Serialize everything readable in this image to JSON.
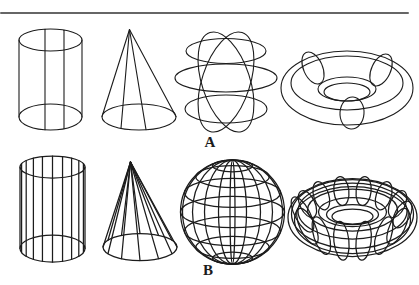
{
  "page": {
    "background": "#ffffff",
    "line_color": "#1c1c1c",
    "rule_color": "#666666"
  },
  "figure": {
    "rows": [
      {
        "label": "A",
        "style": "coarse-wireframe",
        "shapes": [
          "cylinder",
          "cone",
          "sphere",
          "torus"
        ]
      },
      {
        "label": "B",
        "style": "dense-wireframe",
        "shapes": [
          "cylinder",
          "cone",
          "sphere",
          "torus"
        ]
      }
    ]
  }
}
